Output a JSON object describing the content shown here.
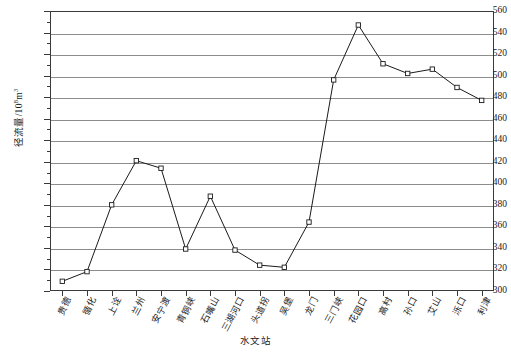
{
  "chart_data": {
    "type": "line",
    "title": "",
    "xlabel": "水文站",
    "ylabel": "径流量/10⁸m³",
    "ylim": [
      300,
      560
    ],
    "ytick_step": 20,
    "grid": true,
    "legend": "none",
    "marker": "open-square",
    "line_color": "#1a1a1a",
    "grid_color": "#8d8d8d",
    "categories": [
      "贵德",
      "循化",
      "上诠",
      "兰州",
      "安宁渡",
      "青铜峡",
      "石嘴山",
      "三湖河口",
      "头道拐",
      "吴堡",
      "龙门",
      "三门峡",
      "花园口",
      "高村",
      "孙口",
      "艾山",
      "泺口",
      "利津"
    ],
    "values": [
      309,
      318,
      380,
      421,
      414,
      339,
      388,
      338,
      324,
      322,
      364,
      496,
      547,
      511,
      502,
      506,
      489,
      477
    ],
    "yticks": [
      300,
      320,
      340,
      360,
      380,
      400,
      420,
      440,
      460,
      480,
      500,
      520,
      540,
      560
    ],
    "ytick_labels": [
      "300",
      "320",
      "340",
      "360",
      "380",
      "400",
      "420",
      "440",
      "460",
      "480",
      "500",
      "520",
      "540",
      "560"
    ],
    "series": [
      {
        "name": "径流量",
        "values": [
          309,
          318,
          380,
          421,
          414,
          339,
          388,
          338,
          324,
          322,
          364,
          496,
          547,
          511,
          502,
          506,
          489,
          477
        ]
      }
    ]
  },
  "axis": {
    "y_title_main": "径流量/10",
    "y_title_sup": "8",
    "y_title_tail": "m",
    "y_title_sup2": "3",
    "x_title": "水文站"
  },
  "caption": {
    "text": ""
  }
}
